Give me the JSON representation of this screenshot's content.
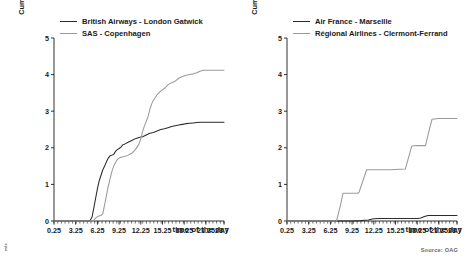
{
  "figure": {
    "source_note": "Source: OAG",
    "corner_mark": "m/s"
  },
  "chart_data": [
    {
      "type": "line",
      "panel_index": 0,
      "title": "",
      "xlabel": "time of the day",
      "ylabel": "Cumulative sum of weighted indirect connections (x 1,000)",
      "ylabel_line1": "Cumulative sum of weighted indirect",
      "ylabel_line2": "connections (x 1,000)",
      "xlim": [
        0.25,
        23.75
      ],
      "ylim": [
        0,
        5
      ],
      "yticks": [
        0,
        1,
        2,
        3,
        4,
        5
      ],
      "xticks": [
        0.25,
        3.25,
        6.25,
        9.25,
        12.25,
        15.25,
        18.25,
        21.25,
        23.75
      ],
      "xtick_labels": [
        "0.25",
        "3.25",
        "6.25",
        "9.25",
        "12.25",
        "15.25",
        "18.25",
        "21.25",
        "23.75"
      ],
      "ytick_labels": [
        "0",
        "1",
        "2",
        "3",
        "4",
        "5"
      ],
      "grid": false,
      "legend_position": "top-left",
      "series": [
        {
          "name": "British Airways - London Gatwick",
          "color": "#2b2b2b",
          "x": [
            0.25,
            1.25,
            2.25,
            3.25,
            4.25,
            5.0,
            5.25,
            5.5,
            5.75,
            6.0,
            6.25,
            6.5,
            6.75,
            7.0,
            7.25,
            7.5,
            7.75,
            8.0,
            8.25,
            8.5,
            8.75,
            9.0,
            9.25,
            9.5,
            9.75,
            10.0,
            10.5,
            11.0,
            11.5,
            12.0,
            12.5,
            13.0,
            13.5,
            14.0,
            14.5,
            15.0,
            15.5,
            16.0,
            16.5,
            17.0,
            17.5,
            18.0,
            18.5,
            19.0,
            19.5,
            20.0,
            20.5,
            21.0,
            21.5,
            22.0,
            22.5,
            23.0,
            23.75
          ],
          "y": [
            0.0,
            0.0,
            0.0,
            0.0,
            0.0,
            0.0,
            0.02,
            0.1,
            0.35,
            0.62,
            0.88,
            1.1,
            1.25,
            1.4,
            1.5,
            1.62,
            1.72,
            1.78,
            1.8,
            1.82,
            1.9,
            1.95,
            1.98,
            2.02,
            2.08,
            2.1,
            2.15,
            2.2,
            2.25,
            2.28,
            2.3,
            2.35,
            2.4,
            2.42,
            2.46,
            2.5,
            2.52,
            2.55,
            2.58,
            2.6,
            2.62,
            2.64,
            2.66,
            2.67,
            2.68,
            2.69,
            2.7,
            2.7,
            2.7,
            2.7,
            2.7,
            2.7,
            2.7
          ]
        },
        {
          "name": "SAS - Copenhagen",
          "color": "#9a9a9a",
          "x": [
            0.25,
            1.25,
            2.25,
            3.25,
            4.25,
            5.25,
            5.75,
            6.0,
            6.25,
            6.5,
            6.75,
            7.0,
            7.25,
            7.5,
            7.75,
            8.0,
            8.25,
            8.5,
            8.75,
            9.0,
            9.25,
            9.5,
            9.75,
            10.0,
            10.5,
            11.0,
            11.5,
            12.0,
            12.25,
            12.5,
            12.75,
            13.0,
            13.25,
            13.5,
            13.75,
            14.0,
            14.5,
            15.0,
            15.5,
            16.0,
            16.5,
            17.0,
            17.5,
            18.0,
            18.5,
            19.0,
            19.5,
            20.0,
            20.5,
            21.0,
            21.5,
            22.0,
            23.0,
            23.75
          ],
          "y": [
            0.0,
            0.0,
            0.0,
            0.0,
            0.0,
            0.0,
            0.02,
            0.08,
            0.12,
            0.14,
            0.15,
            0.2,
            0.45,
            0.7,
            0.95,
            1.15,
            1.35,
            1.5,
            1.6,
            1.68,
            1.72,
            1.74,
            1.75,
            1.76,
            1.8,
            1.85,
            1.95,
            2.1,
            2.25,
            2.45,
            2.6,
            2.72,
            2.85,
            3.05,
            3.2,
            3.3,
            3.45,
            3.55,
            3.62,
            3.72,
            3.78,
            3.82,
            3.9,
            3.95,
            3.98,
            4.0,
            4.02,
            4.05,
            4.1,
            4.12,
            4.12,
            4.12,
            4.12,
            4.12
          ]
        }
      ]
    },
    {
      "type": "line",
      "panel_index": 1,
      "title": "",
      "xlabel": "time of the day",
      "ylabel": "Cumulative sum of weighted indirect connections (x 1,000)",
      "ylabel_line1": "Cumulative sum of weighted indirect",
      "ylabel_line2": "connections (x 1,000)",
      "xlim": [
        0.25,
        23.75
      ],
      "ylim": [
        0,
        5
      ],
      "yticks": [
        0,
        1,
        2,
        3,
        4,
        5
      ],
      "xticks": [
        0.25,
        3.25,
        6.25,
        9.25,
        12.25,
        15.25,
        18.25,
        21.25,
        23.75
      ],
      "xtick_labels": [
        "0.25",
        "3.25",
        "6.25",
        "9.25",
        "12.25",
        "15.25",
        "18.25",
        "21.25",
        "23.75"
      ],
      "ytick_labels": [
        "0",
        "1",
        "2",
        "3",
        "4",
        "5"
      ],
      "grid": false,
      "legend_position": "top-left",
      "series": [
        {
          "name": "Air France - Marseille",
          "color": "#2b2b2b",
          "x": [
            0.25,
            3.25,
            6.25,
            9.25,
            10.5,
            11.0,
            11.5,
            11.75,
            12.25,
            13.0,
            14.0,
            15.25,
            16.5,
            17.5,
            18.25,
            18.75,
            19.25,
            19.75,
            20.25,
            21.25,
            22.25,
            23.0,
            23.75
          ],
          "y": [
            0.0,
            0.0,
            0.0,
            0.0,
            0.01,
            0.02,
            0.03,
            0.04,
            0.06,
            0.07,
            0.07,
            0.07,
            0.07,
            0.07,
            0.07,
            0.08,
            0.12,
            0.15,
            0.15,
            0.15,
            0.15,
            0.15,
            0.15
          ]
        },
        {
          "name": "Régional Airlines - Clermont-Ferrand",
          "color": "#9a9a9a",
          "x": [
            0.25,
            3.25,
            6.25,
            7.1,
            7.6,
            8.0,
            10.0,
            10.2,
            10.75,
            11.25,
            12.25,
            14.5,
            16.6,
            17.0,
            17.5,
            18.25,
            19.4,
            19.8,
            20.3,
            21.25,
            23.75
          ],
          "y": [
            0.0,
            0.0,
            0.0,
            0.0,
            0.4,
            0.76,
            0.76,
            0.78,
            1.1,
            1.4,
            1.4,
            1.4,
            1.42,
            1.7,
            2.05,
            2.06,
            2.06,
            2.4,
            2.78,
            2.8,
            2.8
          ]
        }
      ]
    }
  ]
}
